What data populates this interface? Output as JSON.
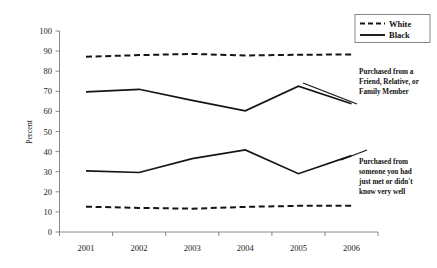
{
  "chart_data": {
    "type": "line",
    "title": "",
    "xlabel": "",
    "ylabel": "Percent",
    "categories": [
      "2001",
      "2002",
      "2003",
      "2004",
      "2005",
      "2006"
    ],
    "ylim": [
      0,
      100
    ],
    "yticks": [
      0,
      10,
      20,
      30,
      40,
      50,
      60,
      70,
      80,
      90,
      100
    ],
    "grid": false,
    "legend_position": "top-right",
    "series": [
      {
        "name": "White",
        "group": "Purchased from a Friend, Relative, or Family Member",
        "style": "dashed",
        "values": [
          87.2,
          88.0,
          88.6,
          87.8,
          88.2,
          88.3
        ]
      },
      {
        "name": "Black",
        "group": "Purchased from a Friend, Relative, or Family Member",
        "style": "solid",
        "values": [
          69.7,
          71.0,
          65.5,
          60.3,
          72.5,
          63.8
        ]
      },
      {
        "name": "Black",
        "group": "Purchased from someone you had just met or didn't know very well",
        "style": "solid",
        "values": [
          30.4,
          29.6,
          36.5,
          40.8,
          29.0,
          38.0
        ]
      },
      {
        "name": "White",
        "group": "Purchased from someone you had just met or didn't know very well",
        "style": "dashed",
        "values": [
          12.6,
          12.0,
          11.6,
          12.5,
          13.0,
          13.0
        ]
      }
    ]
  },
  "legend": {
    "entries": [
      {
        "label": "White",
        "style": "dashed"
      },
      {
        "label": "Black",
        "style": "solid"
      }
    ]
  },
  "annotations": {
    "top": {
      "lines": [
        "Purchased from a",
        "Friend, Relative, or",
        "Family Member"
      ]
    },
    "bottom": {
      "lines": [
        "Purchased from",
        "someone you had",
        "just met or didn't",
        "know very well"
      ]
    }
  },
  "axis": {
    "y_title": "Percent",
    "y_tick_labels": [
      "100",
      "90",
      "80",
      "70",
      "60",
      "50",
      "40",
      "30",
      "20",
      "10",
      "0"
    ],
    "x_tick_labels": [
      "2001",
      "2002",
      "2003",
      "2004",
      "2005",
      "2006"
    ]
  },
  "colors": {
    "line": "#151515",
    "axis": "#7a7a7a",
    "background": "#ffffff"
  }
}
